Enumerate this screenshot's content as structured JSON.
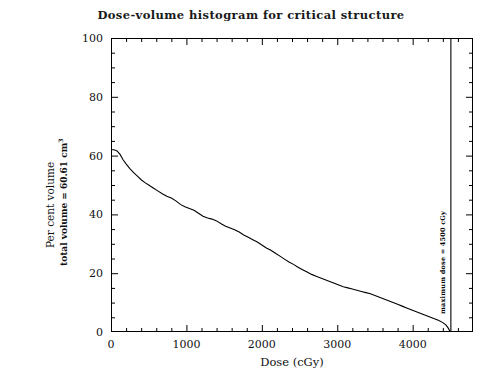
{
  "chart_data": {
    "type": "line",
    "title": "Dose-volume histogram for critical structure",
    "xlabel": "Dose (cGy)",
    "ylabel": "Per cent volume",
    "ylabel_sub": "total volume =  60.61 cm",
    "ylabel_sub_sup": "3",
    "xlim": [
      0,
      4800
    ],
    "ylim": [
      0,
      100
    ],
    "xticks": [
      0,
      1000,
      2000,
      3000,
      4000
    ],
    "xtick_labels": [
      "0",
      "1000",
      "2000",
      "3000",
      "4000"
    ],
    "yticks": [
      0,
      20,
      40,
      60,
      80,
      100
    ],
    "ytick_labels": [
      "0",
      "20",
      "40",
      "60",
      "80",
      "100"
    ],
    "x_minor_interval": 200,
    "y_minor_interval": 5,
    "grid": false,
    "legend": null,
    "line_color": "#000000",
    "annotations": [
      {
        "name": "maximum-dose",
        "text": "maximum dose =  4500  cGy",
        "x": 4500,
        "type": "vertical-line",
        "orientation": "vertical"
      }
    ],
    "x": [
      0,
      40,
      80,
      120,
      160,
      200,
      250,
      300,
      350,
      400,
      450,
      500,
      560,
      620,
      680,
      740,
      800,
      860,
      920,
      980,
      1040,
      1100,
      1160,
      1220,
      1280,
      1340,
      1400,
      1460,
      1520,
      1580,
      1640,
      1700,
      1760,
      1820,
      1880,
      1940,
      2000,
      2060,
      2120,
      2180,
      2240,
      2300,
      2360,
      2420,
      2480,
      2540,
      2600,
      2660,
      2720,
      2780,
      2840,
      2900,
      2960,
      3020,
      3080,
      3140,
      3200,
      3260,
      3320,
      3380,
      3440,
      3500,
      3560,
      3620,
      3680,
      3740,
      3800,
      3860,
      3920,
      3980,
      4040,
      4100,
      4160,
      4220,
      4280,
      4340,
      4400,
      4440,
      4470,
      4500
    ],
    "y": [
      62.0,
      62.0,
      61.6,
      60.4,
      58.6,
      57.2,
      55.6,
      54.2,
      53.0,
      51.8,
      50.8,
      50.0,
      49.0,
      48.0,
      47.0,
      46.2,
      45.6,
      44.6,
      43.4,
      42.6,
      42.0,
      41.4,
      40.4,
      39.4,
      38.8,
      38.4,
      37.8,
      36.8,
      36.0,
      35.4,
      34.8,
      34.0,
      33.0,
      32.2,
      31.4,
      30.6,
      29.6,
      28.6,
      27.8,
      26.8,
      25.8,
      24.8,
      23.8,
      23.0,
      22.0,
      21.2,
      20.4,
      19.6,
      19.0,
      18.4,
      17.8,
      17.2,
      16.6,
      16.0,
      15.4,
      15.0,
      14.6,
      14.2,
      13.8,
      13.4,
      13.0,
      12.4,
      11.8,
      11.2,
      10.6,
      10.0,
      9.4,
      8.8,
      8.2,
      7.6,
      7.0,
      6.4,
      5.8,
      5.2,
      4.6,
      4.0,
      3.2,
      2.4,
      1.4,
      0.0
    ]
  }
}
